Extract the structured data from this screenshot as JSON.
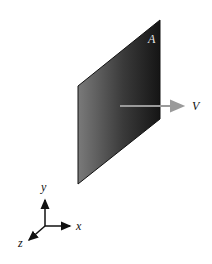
{
  "diagram": {
    "plate": {
      "label": "A",
      "gradient_left": "#7a7a7a",
      "gradient_right": "#151515"
    },
    "velocity_arrow": {
      "label": "V",
      "color": "#9a9a9a"
    },
    "axes": {
      "x_label": "x",
      "y_label": "y",
      "z_label": "z",
      "color": "#111111"
    }
  }
}
